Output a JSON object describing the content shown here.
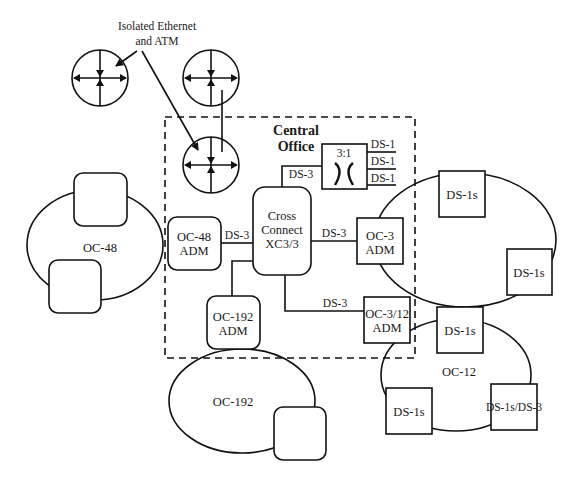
{
  "diagram": {
    "callout": {
      "line1": "Isolated Ethernet",
      "line2": "and ATM"
    },
    "central_office": {
      "line1": "Central",
      "line2": "Office"
    },
    "mux": {
      "ratio": "3:1",
      "outputs": [
        "DS-1",
        "DS-1",
        "DS-1"
      ],
      "input_label": "DS-3"
    },
    "cross_connect": {
      "line1": "Cross",
      "line2": "Connect",
      "line3": "XC3/3"
    },
    "adms": {
      "oc48": {
        "line1": "OC-48",
        "line2": "ADM"
      },
      "oc3": {
        "line1": "OC-3",
        "line2": "ADM"
      },
      "oc192": {
        "line1": "OC-192",
        "line2": "ADM"
      },
      "oc312": {
        "line1": "OC-3/12",
        "line2": "ADM"
      }
    },
    "links": {
      "oc48_to_xc": "DS-3",
      "xc_to_oc3": "DS-3",
      "xc_to_oc312": "DS-3"
    },
    "rings": {
      "oc48": "OC-48",
      "oc192": "OC-192",
      "oc12": "OC-12"
    },
    "oc3_ring_nodes": [
      "DS-1s",
      "DS-1s"
    ],
    "oc12_ring_nodes": [
      "DS-1s",
      "DS-1s",
      "DS-1s/DS-3"
    ]
  }
}
